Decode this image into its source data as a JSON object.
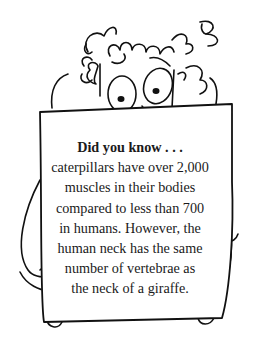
{
  "illustration": {
    "subject": "cartoon character with curly hair peeking over a sign held in both hands"
  },
  "sign": {
    "heading": "Did you know . . .",
    "lines": [
      "caterpillars have over 2,000",
      "muscles in their bodies",
      "compared to less than 700",
      "in humans. However, the",
      "human neck has the same",
      "number of vertebrae as",
      "the neck of a giraffe."
    ]
  }
}
